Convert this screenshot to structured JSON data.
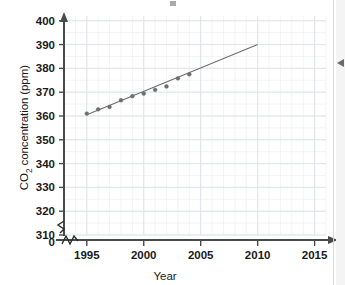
{
  "figure": {
    "ylabel": "CO2 concentration (ppm)",
    "ylabel_main": "CO",
    "ylabel_sub": "2",
    "ylabel_rest": " concentration (ppm)",
    "xlabel": "Year",
    "y_break_label": "0",
    "margin_marker": "left-pointing-triangle"
  },
  "chart_data": {
    "type": "scatter",
    "title": "",
    "xlabel": "Year",
    "ylabel": "CO2 concentration (ppm)",
    "xlim": [
      1993,
      2016
    ],
    "ylim": [
      310,
      402
    ],
    "axis_break_y": true,
    "axis_break_value": 0,
    "grid": true,
    "grid_minor": true,
    "legend": "none",
    "x_ticks": [
      1995,
      2000,
      2005,
      2010,
      2015
    ],
    "x_tick_labels": [
      "1995",
      "2000",
      "2005",
      "2010",
      "2015"
    ],
    "y_ticks": [
      310,
      320,
      330,
      340,
      350,
      360,
      370,
      380,
      390,
      400
    ],
    "y_tick_labels": [
      "310",
      "320",
      "330",
      "340",
      "350",
      "360",
      "370",
      "380",
      "390",
      "400"
    ],
    "y_extra_tick_labels": [
      "0"
    ],
    "x": [
      1995,
      1996,
      1997,
      1998,
      1999,
      2000,
      2001,
      2002,
      2003,
      2004
    ],
    "values": [
      361.0,
      362.8,
      363.8,
      366.6,
      368.3,
      369.4,
      371.0,
      372.4,
      375.8,
      377.5
    ],
    "points": [
      {
        "year": 1995,
        "ppm": 361.0
      },
      {
        "year": 1996,
        "ppm": 362.8
      },
      {
        "year": 1997,
        "ppm": 363.8
      },
      {
        "year": 1998,
        "ppm": 366.6
      },
      {
        "year": 1999,
        "ppm": 368.3
      },
      {
        "year": 2000,
        "ppm": 369.4
      },
      {
        "year": 2001,
        "ppm": 371.0
      },
      {
        "year": 2002,
        "ppm": 372.4
      },
      {
        "year": 2003,
        "ppm": 375.8
      },
      {
        "year": 2004,
        "ppm": 377.5
      }
    ],
    "series": [
      {
        "name": "CO2 concentration",
        "type": "scatter",
        "values": [
          361.0,
          362.8,
          363.8,
          366.6,
          368.3,
          369.4,
          371.0,
          372.4,
          375.8,
          377.5
        ],
        "marker": "filled-circle",
        "color": "#6e6e6e"
      },
      {
        "name": "trend line",
        "type": "line",
        "x": [
          1995,
          2010
        ],
        "values": [
          360.5,
          390.0
        ],
        "color": "#6e6e6e"
      }
    ],
    "trend_line": {
      "x_start": 1995,
      "y_start": 360.5,
      "x_end": 2010,
      "y_end": 390.0
    }
  }
}
